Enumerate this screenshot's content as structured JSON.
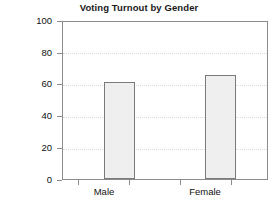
{
  "chart_data": {
    "type": "bar",
    "title": "Voting Turnout by Gender",
    "xlabel": "",
    "ylabel": "",
    "categories": [
      "Male",
      "Female"
    ],
    "values": [
      61.5,
      66.5
    ],
    "ylim": [
      0,
      100
    ],
    "yticks": [
      "0",
      "20",
      "40",
      "60",
      "80",
      "100"
    ],
    "ytick_values": [
      0,
      20,
      40,
      60,
      80,
      100
    ],
    "grid": true,
    "grid_axis": "y",
    "grid_style": "dotted",
    "legend": false,
    "legend_position": "none",
    "bar_fill_color": "#efefef",
    "bar_border_color": "#7a7a7a",
    "frame_color": "#8c8c8c",
    "grid_color": "#d9d9d9",
    "text_color": "#111111",
    "background_color": "#ffffff"
  }
}
